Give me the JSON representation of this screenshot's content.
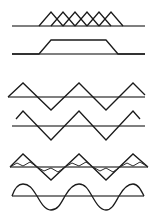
{
  "diagram": {
    "background": "#ffffff",
    "line_color": "#1a1a1a",
    "baseline_color": "#555555",
    "panels": [
      {
        "name": "overlapping-triangles",
        "baseline": {
          "x1": 12,
          "x2": 145,
          "y": 26
        },
        "shapes": [
          "39,26 51,12 63,26",
          "51,26 63,12 75,26",
          "63,26 75,12 87,26",
          "75,26 87,12 99,26",
          "87,26 99,12 111,26",
          "99,26 111,12 123,26"
        ]
      },
      {
        "name": "trapezoid",
        "baseline": {
          "x1": 12,
          "x2": 145,
          "y": 54
        },
        "shapes": [
          "12,54 39,54 51,40 106,40 118,54 145,54"
        ]
      },
      {
        "name": "triangle-wave-on-axis",
        "baseline": {
          "x1": 8,
          "x2": 145,
          "y": 97
        },
        "shapes": [
          "8,97 23,83 51,110 79,83 106,110 133,83 145,95"
        ]
      },
      {
        "name": "triangle-wave-offset",
        "baseline": {
          "x1": 12,
          "x2": 145,
          "y": 126
        },
        "shapes": [
          "16,119 23,111 51,140 79,111 106,140 133,111 140,119"
        ]
      },
      {
        "name": "triangle-wave-with-harmonic",
        "baseline": {
          "x1": 10,
          "x2": 148,
          "y": 167
        },
        "shapes": [
          "10,167 23,154 51,180 79,154 106,180 133,154 148,167",
          "10,167 17,163 23,166 30,162 37,167 44,171 51,168 58,172 65,167 72,163 79,166 86,162 93,167 100,171 106,168 113,172 120,167 127,163 133,166 140,162 148,167"
        ]
      },
      {
        "name": "sine-wave",
        "baseline": {
          "x1": 12,
          "x2": 144,
          "y": 196
        },
        "curve": "M12,196 C15,187 19,184 23,184 C30,184 33,190 37,196 C41,203 45,210 51,210 C58,210 61,203 65,196 C69,189 73,184 79,184 C85,184 88,189 92,196 C96,203 100,210 106,210 C112,210 115,203 119,196 C123,189 127,184 133,184 C138,184 141,190 144,196"
      }
    ]
  }
}
